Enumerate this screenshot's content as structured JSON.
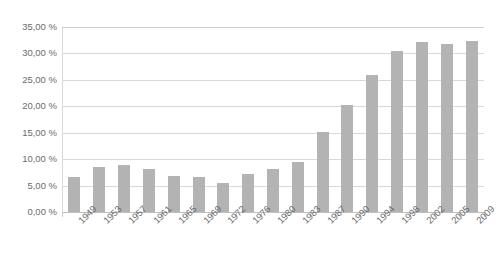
{
  "chart_data": {
    "type": "bar",
    "title": "",
    "xlabel": "",
    "ylabel": "",
    "ylim": [
      0,
      35
    ],
    "grid": true,
    "legend": "none",
    "value_format": "percent-comma",
    "categories": [
      "1949",
      "1953",
      "1957",
      "1961",
      "1965",
      "1969",
      "1972",
      "1976",
      "1980",
      "1983",
      "1987",
      "1990",
      "1994",
      "1998",
      "2002",
      "2005",
      "2009"
    ],
    "values": [
      6.7,
      8.6,
      8.9,
      8.2,
      6.8,
      6.7,
      5.4,
      7.2,
      8.2,
      9.5,
      15.2,
      20.3,
      26.0,
      30.5,
      32.2,
      31.7,
      32.4
    ],
    "y_ticks": [
      {
        "value": 0,
        "label": "0,00 %"
      },
      {
        "value": 5,
        "label": "5,00 %"
      },
      {
        "value": 10,
        "label": "10,00 %"
      },
      {
        "value": 15,
        "label": "15,00 %"
      },
      {
        "value": 20,
        "label": "20,00 %"
      },
      {
        "value": 25,
        "label": "25,00 %"
      },
      {
        "value": 30,
        "label": "30,00 %"
      },
      {
        "value": 35,
        "label": "35,00 %"
      }
    ],
    "colors": {
      "bar": "#b3b3b3",
      "grid": "#d9d9d9",
      "axis": "#bfbfbf",
      "text": "#6b6b6b",
      "background": "#ffffff"
    }
  }
}
